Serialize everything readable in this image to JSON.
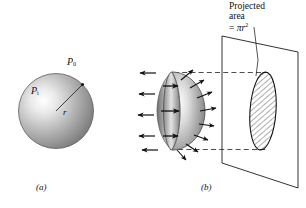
{
  "figure": {
    "panel_a": {
      "caption": "(a)",
      "outside_pressure_label": "P",
      "outside_pressure_sub": "0",
      "inside_pressure_label": "P",
      "inside_pressure_sub": "i",
      "radius_label": "r",
      "description": "Shaded sphere with internal pressure Pi and external pressure P0, radius r drawn from center to surface"
    },
    "panel_b": {
      "caption": "(b)",
      "annotation_line1": "Projected",
      "annotation_line2": "area",
      "annotation_line3_prefix": "= ",
      "annotation_line3_pi": "π",
      "annotation_line3_var": "r",
      "annotation_line3_sup": "2",
      "description": "Shaded hemispherical shell with outward pressure arrows, projected onto a plane as a hatched ellipse of area pi r squared"
    },
    "colors": {
      "ink": "#111111",
      "shell_light": "#f2f2f2",
      "shell_mid": "#9a9a9a",
      "shell_dark": "#5a5a5a",
      "hatch": "#222222",
      "dashed": "#444444"
    }
  }
}
